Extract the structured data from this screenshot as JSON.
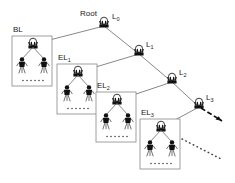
{
  "diagram": {
    "type": "hierarchical-tree",
    "title_label": "Root",
    "colors": {
      "line": "#555555",
      "box_border": "#888888",
      "figure": "#000000",
      "text": "#1a1a1a",
      "background": "#ffffff"
    },
    "level_nodes": [
      {
        "id": "L0",
        "label": "L",
        "sub": "0",
        "x": 104,
        "y": 24,
        "name_label": "Root"
      },
      {
        "id": "L1",
        "label": "L",
        "sub": "1",
        "x": 139,
        "y": 52
      },
      {
        "id": "L2",
        "label": "L",
        "sub": "2",
        "x": 172,
        "y": 80
      },
      {
        "id": "L3",
        "label": "L",
        "sub": "3",
        "x": 199,
        "y": 105
      }
    ],
    "boxes": [
      {
        "id": "BL",
        "label": "BL",
        "sub": "",
        "x": 12,
        "y": 36,
        "w": 40,
        "h": 50,
        "parent": "L0"
      },
      {
        "id": "EL1",
        "label": "EL",
        "sub": "1",
        "x": 57,
        "y": 64,
        "w": 40,
        "h": 50,
        "parent": "L1"
      },
      {
        "id": "EL2",
        "label": "EL",
        "sub": "2",
        "x": 96,
        "y": 92,
        "w": 40,
        "h": 50,
        "parent": "L2"
      },
      {
        "id": "EL3",
        "label": "EL",
        "sub": "3",
        "x": 140,
        "y": 119,
        "w": 40,
        "h": 50,
        "parent": "L3"
      }
    ],
    "edges": [
      {
        "from": "L0",
        "to": "BL"
      },
      {
        "from": "L0",
        "to": "L1"
      },
      {
        "from": "L1",
        "to": "EL1"
      },
      {
        "from": "L1",
        "to": "L2"
      },
      {
        "from": "L2",
        "to": "EL2"
      },
      {
        "from": "L2",
        "to": "L3"
      },
      {
        "from": "L3",
        "to": "EL3"
      }
    ],
    "continuation": {
      "dashed_arrow_from": "L3",
      "dotted_line": "lower-right ellipsis path"
    },
    "box_contents": {
      "parent_node": "antenna-node-icon",
      "children": 2,
      "child_icon": "person-figure-icon",
      "ellipsis_dots": 6
    }
  }
}
